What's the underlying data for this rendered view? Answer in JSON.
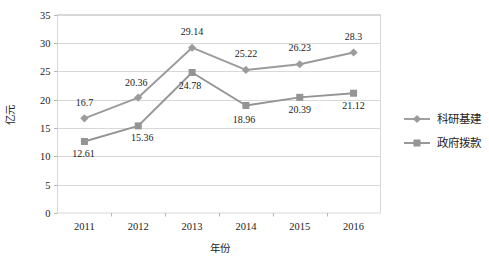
{
  "chart_data": {
    "type": "line",
    "title": "",
    "subtitle": "",
    "xlabel": "年份",
    "ylabel": "亿元",
    "categories": [
      "2011",
      "2012",
      "2013",
      "2014",
      "2015",
      "2016"
    ],
    "x": [
      2011,
      2012,
      2013,
      2014,
      2015,
      2016
    ],
    "ylim": [
      0,
      35
    ],
    "ytick_step": 5,
    "yticks": [
      "0",
      "5",
      "10",
      "15",
      "20",
      "25",
      "30",
      "35"
    ],
    "grid": "horizontal",
    "legend_position": "right",
    "series": [
      {
        "name": "科研基建",
        "marker": "diamond",
        "color": "#9b9b9b",
        "values": [
          16.7,
          20.36,
          29.14,
          25.22,
          26.23,
          28.3
        ],
        "labels": [
          "16.7",
          "20.36",
          "29.14",
          "25.22",
          "26.23",
          "28.3"
        ]
      },
      {
        "name": "政府拨款",
        "marker": "square",
        "color": "#949494",
        "values": [
          12.61,
          15.36,
          24.78,
          18.96,
          20.39,
          21.12
        ],
        "labels": [
          "12.61",
          "15.36",
          "24.78",
          "18.96",
          "20.39",
          "21.12"
        ]
      }
    ]
  },
  "legend": {
    "items": [
      {
        "label": "科研基建",
        "marker": "diamond"
      },
      {
        "label": "政府拨款",
        "marker": "square"
      }
    ]
  },
  "caption": {
    "text": ""
  }
}
